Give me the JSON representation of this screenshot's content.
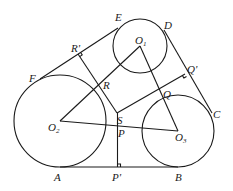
{
  "diagram": {
    "type": "geometry",
    "circles": [
      {
        "id": "O1",
        "cx": 140,
        "cy": 46,
        "r": 27
      },
      {
        "id": "O2",
        "cx": 60,
        "cy": 121,
        "r": 46
      },
      {
        "id": "O3",
        "cx": 178,
        "cy": 131,
        "r": 36
      }
    ],
    "points": {
      "A": [
        60,
        167
      ],
      "B": [
        178,
        167
      ],
      "C": [
        212,
        113
      ],
      "D": [
        164,
        30
      ],
      "E": [
        118,
        28
      ],
      "F": [
        40,
        79
      ],
      "O1": [
        140,
        46
      ],
      "O2": [
        60,
        121
      ],
      "O3": [
        178,
        131
      ],
      "P": [
        118,
        126
      ],
      "P'": [
        118,
        167
      ],
      "Q": [
        164,
        88
      ],
      "Q'": [
        185,
        74
      ],
      "R": [
        99,
        86
      ],
      "R'": [
        78,
        54
      ],
      "S": [
        117,
        113
      ]
    },
    "labels": {
      "E": "E",
      "D": "D",
      "O1_main": "O",
      "O1_sub": "1",
      "R_prime": "R'",
      "Q_prime": "Q'",
      "F": "F",
      "R": "R",
      "Q": "Q",
      "S": "S",
      "C": "C",
      "O2_main": "O",
      "O2_sub": "2",
      "P": "P",
      "O3_main": "O",
      "O3_sub": "3",
      "A": "A",
      "P_prime": "P'",
      "B": "B"
    }
  }
}
